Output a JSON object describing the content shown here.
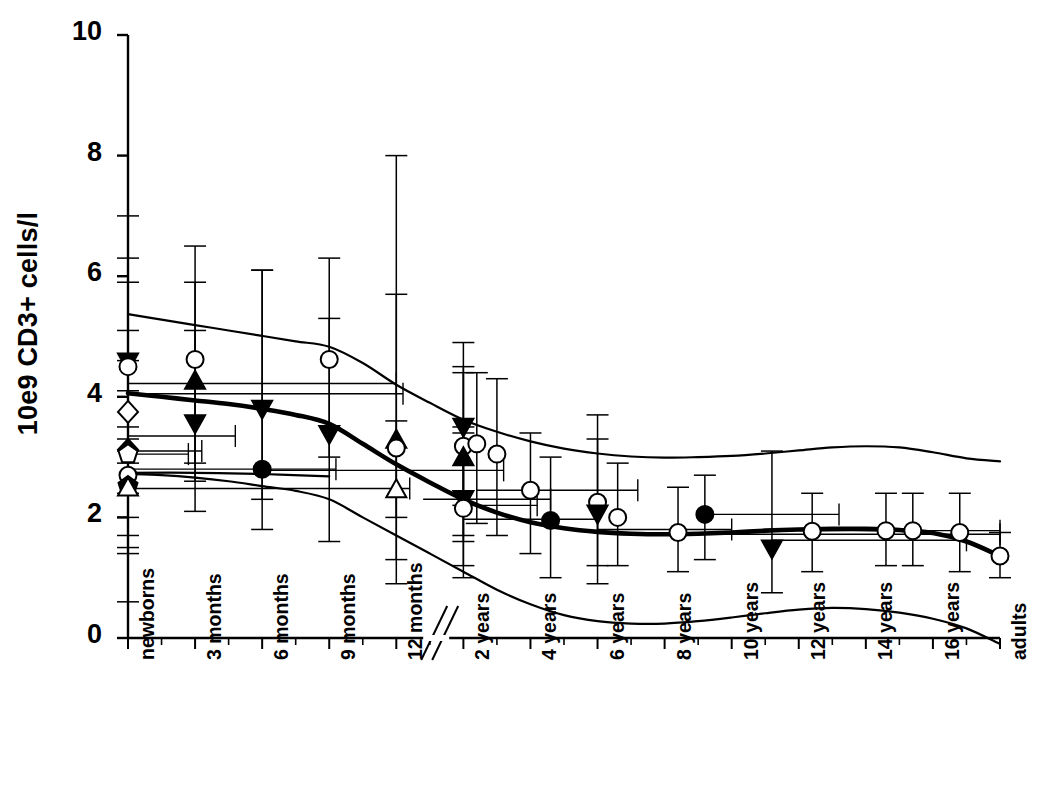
{
  "chart_data": {
    "type": "scatter",
    "title": "",
    "subtitle": "",
    "xlabel": "",
    "ylabel": "10e9 CD3+ cells/l",
    "ylim": [
      0,
      10
    ],
    "yticks": [
      0,
      2,
      4,
      6,
      8,
      10
    ],
    "grid": false,
    "legend": false,
    "axis_break": {
      "present": true,
      "between": [
        "12 months",
        "2 years"
      ],
      "style": "double-diagonal-slash"
    },
    "categories": [
      "newborns",
      "3 months",
      "6 months",
      "9 months",
      "12 months",
      "2 years",
      "4 years",
      "6 years",
      "8 years",
      "10 years",
      "12 years",
      "14 years",
      "16 years",
      "adults"
    ],
    "xtick_labels": [
      "newborns",
      "3 months",
      "6 months",
      "9 months",
      "12 months",
      "2 years",
      "4 years",
      "6 years",
      "8 years",
      "10 years",
      "12 years",
      "14 years",
      "16 years",
      "adults"
    ],
    "reference_curves": [
      {
        "name": "upper percentile",
        "style": "thin-solid",
        "x": [
          0.0,
          0.5,
          1.0,
          1.5,
          2.0,
          2.5,
          3.0,
          3.5,
          4.0,
          4.5,
          5.0,
          5.5,
          6.0,
          6.5,
          7.0,
          7.5,
          8.0,
          8.5,
          9.0,
          9.5,
          10.0,
          10.5,
          11.0,
          11.5,
          12.0,
          12.5,
          13.0
        ],
        "y": [
          5.37,
          5.28,
          5.19,
          5.1,
          5.01,
          4.92,
          4.83,
          4.56,
          4.2,
          3.9,
          3.62,
          3.42,
          3.26,
          3.14,
          3.06,
          3.01,
          2.99,
          3.0,
          3.02,
          3.06,
          3.11,
          3.16,
          3.18,
          3.16,
          3.08,
          2.98,
          2.93
        ]
      },
      {
        "name": "median",
        "style": "thick-solid",
        "x": [
          0.0,
          0.5,
          1.0,
          1.5,
          2.0,
          2.5,
          3.0,
          3.5,
          4.0,
          4.5,
          5.0,
          5.5,
          6.0,
          6.5,
          7.0,
          7.5,
          8.0,
          8.5,
          9.0,
          9.5,
          10.0,
          10.5,
          11.0,
          11.5,
          12.0,
          12.5,
          13.0
        ],
        "y": [
          4.06,
          4.0,
          3.94,
          3.88,
          3.8,
          3.7,
          3.55,
          3.22,
          2.88,
          2.58,
          2.3,
          2.08,
          1.92,
          1.82,
          1.76,
          1.73,
          1.72,
          1.73,
          1.75,
          1.78,
          1.8,
          1.81,
          1.81,
          1.79,
          1.74,
          1.6,
          1.36
        ]
      },
      {
        "name": "lower percentile",
        "style": "thin-solid",
        "x": [
          0.0,
          0.5,
          1.0,
          1.5,
          2.0,
          2.5,
          3.0,
          3.5,
          4.0,
          4.5,
          5.0,
          5.5,
          6.0,
          6.5,
          7.0,
          7.5,
          8.0,
          8.5,
          9.0,
          9.5,
          10.0,
          10.5,
          11.0,
          11.5,
          12.0,
          12.5,
          13.0
        ],
        "y": [
          2.72,
          2.7,
          2.66,
          2.6,
          2.52,
          2.44,
          2.3,
          2.0,
          1.7,
          1.4,
          1.1,
          0.8,
          0.56,
          0.38,
          0.28,
          0.24,
          0.24,
          0.28,
          0.34,
          0.41,
          0.47,
          0.5,
          0.48,
          0.42,
          0.32,
          0.16,
          -0.1
        ]
      },
      {
        "name": "median secondary",
        "style": "thin-solid-flat",
        "x": [
          0.0,
          1.0,
          2.0,
          3.0
        ],
        "y": [
          2.74,
          2.74,
          2.72,
          2.68
        ]
      }
    ],
    "points": [
      {
        "x": 0.0,
        "y": 4.6,
        "marker": "filled-down-triangle",
        "yerr_low": 2.9,
        "yerr_high": 6.3
      },
      {
        "x": 0.0,
        "y": 4.5,
        "marker": "open-circle",
        "yerr_low": 3.1,
        "yerr_high": 5.9
      },
      {
        "x": 0.0,
        "y": 3.75,
        "marker": "open-diamond",
        "yerr_low": 2.4,
        "yerr_high": 5.1
      },
      {
        "x": 0.0,
        "y": 3.12,
        "marker": "filled-diamond",
        "yerr_low": 1.7,
        "yerr_high": 4.6
      },
      {
        "x": 0.0,
        "y": 3.05,
        "marker": "open-pentagon",
        "yerr_low": 2.0,
        "yerr_high": 4.1
      },
      {
        "x": 0.0,
        "y": 2.7,
        "marker": "open-circle",
        "yerr_low": 0.6,
        "yerr_high": 7.0
      },
      {
        "x": 0.0,
        "y": 2.52,
        "marker": "filled-pentagon",
        "yerr_low": 1.4,
        "yerr_high": 3.5
      },
      {
        "x": 0.0,
        "y": 2.48,
        "marker": "open-up-triangle",
        "yerr_low": 1.5,
        "yerr_high": 3.3
      },
      {
        "x": 1.0,
        "y": 4.62,
        "marker": "open-circle",
        "yerr_low": 2.9,
        "yerr_high": 6.5
      },
      {
        "x": 1.0,
        "y": 4.25,
        "marker": "filled-up-triangle",
        "yerr_low": 2.6,
        "yerr_high": 5.9
      },
      {
        "x": 1.0,
        "y": 3.58,
        "marker": "filled-down-triangle",
        "yerr_low": 2.1,
        "yerr_high": 5.1
      },
      {
        "x": 2.0,
        "y": 3.82,
        "marker": "filled-down-triangle",
        "yerr_low": 2.3,
        "yerr_high": 6.1
      },
      {
        "x": 2.0,
        "y": 2.8,
        "marker": "filled-circle",
        "yerr_low": 1.8,
        "yerr_high": 6.1
      },
      {
        "x": 3.0,
        "y": 4.62,
        "marker": "open-circle",
        "yerr_low": 3.0,
        "yerr_high": 6.3
      },
      {
        "x": 3.0,
        "y": 3.4,
        "marker": "filled-down-triangle",
        "yerr_low": 1.6,
        "yerr_high": 5.3
      },
      {
        "x": 4.0,
        "y": 3.27,
        "marker": "filled-up-triangle",
        "yerr_low": 2.0,
        "yerr_high": 5.7
      },
      {
        "x": 4.0,
        "y": 2.45,
        "marker": "open-up-triangle",
        "yerr_low": 1.3,
        "yerr_high": 3.6
      },
      {
        "x": 4.0,
        "y": 3.15,
        "marker": "open-circle",
        "yerr_low": 0.9,
        "yerr_high": 8.0
      },
      {
        "x": 5.0,
        "y": 3.52,
        "marker": "filled-down-triangle",
        "yerr_low": 2.2,
        "yerr_high": 4.9
      },
      {
        "x": 5.0,
        "y": 3.18,
        "marker": "open-circle",
        "yerr_low": 1.7,
        "yerr_high": 4.5
      },
      {
        "x": 5.0,
        "y": 2.98,
        "marker": "filled-up-triangle",
        "yerr_low": 1.6,
        "yerr_high": 4.4
      },
      {
        "x": 5.0,
        "y": 2.32,
        "marker": "filled-down-triangle",
        "yerr_low": 1.2,
        "yerr_high": 3.5
      },
      {
        "x": 5.0,
        "y": 2.15,
        "marker": "open-circle",
        "yerr_low": 1.0,
        "yerr_high": 3.4
      },
      {
        "x": 5.2,
        "y": 3.22,
        "marker": "open-circle",
        "yerr_low": 1.9,
        "yerr_high": 4.4
      },
      {
        "x": 5.5,
        "y": 3.05,
        "marker": "open-circle",
        "yerr_low": 1.7,
        "yerr_high": 4.3
      },
      {
        "x": 6.0,
        "y": 2.45,
        "marker": "open-circle",
        "yerr_low": 1.4,
        "yerr_high": 3.4
      },
      {
        "x": 6.3,
        "y": 1.95,
        "marker": "filled-circle",
        "yerr_low": 1.0,
        "yerr_high": 3.0
      },
      {
        "x": 7.0,
        "y": 2.25,
        "marker": "open-circle",
        "yerr_low": 1.2,
        "yerr_high": 3.7
      },
      {
        "x": 7.0,
        "y": 2.08,
        "marker": "filled-down-triangle",
        "yerr_low": 0.9,
        "yerr_high": 3.3
      },
      {
        "x": 7.3,
        "y": 2.0,
        "marker": "open-circle",
        "yerr_low": 1.2,
        "yerr_high": 2.9
      },
      {
        "x": 8.2,
        "y": 1.75,
        "marker": "open-circle",
        "yerr_low": 1.1,
        "yerr_high": 2.5
      },
      {
        "x": 8.6,
        "y": 2.05,
        "marker": "filled-circle",
        "yerr_low": 1.3,
        "yerr_high": 2.7
      },
      {
        "x": 9.6,
        "y": 1.5,
        "marker": "filled-down-triangle",
        "yerr_low": 0.75,
        "yerr_high": 3.1
      },
      {
        "x": 10.2,
        "y": 1.77,
        "marker": "open-circle",
        "yerr_low": 1.1,
        "yerr_high": 2.4
      },
      {
        "x": 11.3,
        "y": 1.78,
        "marker": "open-circle",
        "yerr_low": 1.2,
        "yerr_high": 2.4
      },
      {
        "x": 11.7,
        "y": 1.78,
        "marker": "open-circle",
        "yerr_low": 1.2,
        "yerr_high": 2.4
      },
      {
        "x": 12.4,
        "y": 1.75,
        "marker": "open-circle",
        "yerr_low": 1.1,
        "yerr_high": 2.4
      },
      {
        "x": 13.0,
        "y": 1.36,
        "marker": "open-circle",
        "yerr_low": 1.0,
        "yerr_high": 1.75
      }
    ],
    "horizontal_error_bars": [
      {
        "y": 4.22,
        "x_low": 0.0,
        "x_high": 4.0
      },
      {
        "y": 4.05,
        "x_low": 0.0,
        "x_high": 4.1
      },
      {
        "y": 3.35,
        "x_low": 0.0,
        "x_high": 1.6
      },
      {
        "y": 3.1,
        "x_low": 0.0,
        "x_high": 1.1
      },
      {
        "y": 3.05,
        "x_low": 0.0,
        "x_high": 0.9
      },
      {
        "y": 2.8,
        "x_low": 0.0,
        "x_high": 3.1
      },
      {
        "y": 2.78,
        "x_low": 2.0,
        "x_high": 5.6
      },
      {
        "y": 2.48,
        "x_low": 0.0,
        "x_high": 4.2
      },
      {
        "y": 2.45,
        "x_low": 5.2,
        "x_high": 7.6
      },
      {
        "y": 2.3,
        "x_low": 4.4,
        "x_high": 6.3
      },
      {
        "y": 2.2,
        "x_low": 5.0,
        "x_high": 6.1
      },
      {
        "y": 2.05,
        "x_low": 8.6,
        "x_high": 10.6
      },
      {
        "y": 1.97,
        "x_low": 5.0,
        "x_high": 7.0
      },
      {
        "y": 1.8,
        "x_low": 7.0,
        "x_high": 9.0
      },
      {
        "y": 1.78,
        "x_low": 10.0,
        "x_high": 13.0
      },
      {
        "y": 1.72,
        "x_low": 8.5,
        "x_high": 13.0
      },
      {
        "y": 1.62,
        "x_low": 9.6,
        "x_high": 12.5
      }
    ]
  }
}
